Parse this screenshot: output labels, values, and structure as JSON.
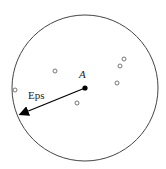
{
  "diagram": {
    "title": "",
    "center_label": "A",
    "radius_label": "Eps",
    "circle": {
      "cx": 85,
      "cy": 88,
      "r": 73
    },
    "center_point": {
      "x": 85,
      "y": 88
    },
    "arrow_end": {
      "x": 19,
      "y": 115
    },
    "neighbor_points": [
      {
        "x": 124,
        "y": 59
      },
      {
        "x": 120,
        "y": 66
      },
      {
        "x": 117,
        "y": 83
      },
      {
        "x": 55,
        "y": 71
      },
      {
        "x": 15,
        "y": 90
      },
      {
        "x": 77,
        "y": 103
      }
    ],
    "colors": {
      "stroke": "#333333",
      "point": "#888888",
      "center": "#000000"
    }
  }
}
